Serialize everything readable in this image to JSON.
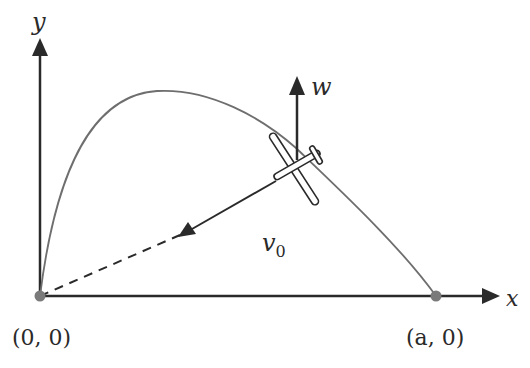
{
  "diagram": {
    "axes": {
      "x_label": "x",
      "y_label": "y"
    },
    "points": {
      "origin_label": "(0, 0)",
      "end_label": "(a, 0)"
    },
    "vectors": {
      "wind_label": "w",
      "velocity_label": "v",
      "velocity_subscript": "0"
    },
    "colors": {
      "axis": "#2a2a2a",
      "curve": "#6e6e6e",
      "point": "#7a7a7a"
    }
  }
}
